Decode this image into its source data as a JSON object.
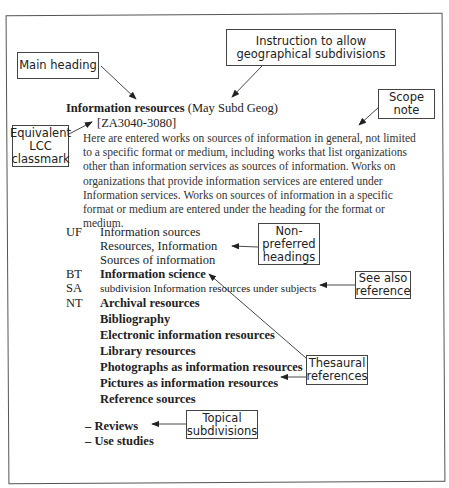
{
  "main_entry": {
    "heading": "Information resources",
    "geog_instruction": "(May Subd Geog)",
    "lcc_classmark": "[ZA3040-3080]",
    "scope_note": "Here are entered works on sources of information in general, not limited to a specific format or medium, including works that list organizations other than information services as sources of information. Works on organizations that provide information services are entered under Information services. Works on sources of information in a specific format or medium are entered under the heading for the format or medium."
  },
  "uf": {
    "code": "UF",
    "terms": [
      "Information sources",
      "Resources, Information",
      "Sources of information"
    ]
  },
  "bt": {
    "code": "BT",
    "term": "Information science"
  },
  "sa": {
    "code": "SA",
    "text": "subdivision Information resources under subjects"
  },
  "nt": {
    "code": "NT",
    "terms": [
      "Archival resources",
      "Bibliography",
      "Electronic information resources",
      "Library resources",
      "Photographs as information resources",
      "Pictures as information resources",
      "Reference sources"
    ]
  },
  "subdivisions": [
    "– Reviews",
    "– Use studies"
  ],
  "callouts": {
    "main_heading": "Main heading",
    "geog_instruction": "Instruction to allow\ngeographical subdivisions",
    "scope_note": "Scope\nnote",
    "lcc": "Equivalent\nLCC\nclassmark",
    "non_preferred": "Non-\npreferred\nheadings",
    "see_also": "See also\nreference",
    "thesaural": "Thesaural\nreferences",
    "topical": "Topical\nsubdivisions"
  }
}
